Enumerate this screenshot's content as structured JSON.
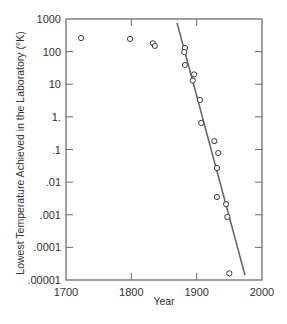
{
  "chart_data": {
    "type": "scatter",
    "title": "",
    "xlabel": "Year",
    "ylabel": "Lowest Temperature Achieved in the Laboratory (°K)",
    "xscale": "linear",
    "yscale": "log",
    "xlim": [
      1700,
      2000
    ],
    "ylim": [
      1e-05,
      1000
    ],
    "grid": false,
    "legend": null,
    "x_ticks": [
      {
        "value": 1700,
        "label": "1700"
      },
      {
        "value": 1800,
        "label": "1800"
      },
      {
        "value": 1900,
        "label": "1900"
      },
      {
        "value": 2000,
        "label": "2000"
      }
    ],
    "y_ticks": [
      {
        "value": 1000,
        "label": "1000"
      },
      {
        "value": 100,
        "label": "100"
      },
      {
        "value": 10,
        "label": "10"
      },
      {
        "value": 1,
        "label": "1."
      },
      {
        "value": 0.1,
        "label": ".1"
      },
      {
        "value": 0.01,
        "label": ".01"
      },
      {
        "value": 0.001,
        "label": ".001"
      },
      {
        "value": 0.0001,
        "label": ".0001"
      },
      {
        "value": 1e-05,
        "label": ".00001"
      }
    ],
    "series": [
      {
        "name": "Lowest temperature achieved",
        "type": "scatter",
        "marker": "open-circle",
        "points": [
          {
            "x": 1723,
            "y": 260
          },
          {
            "x": 1798,
            "y": 245
          },
          {
            "x": 1833,
            "y": 180
          },
          {
            "x": 1836,
            "y": 150
          },
          {
            "x": 1882,
            "y": 130
          },
          {
            "x": 1881,
            "y": 97
          },
          {
            "x": 1882,
            "y": 39
          },
          {
            "x": 1896,
            "y": 20
          },
          {
            "x": 1894,
            "y": 13
          },
          {
            "x": 1905,
            "y": 3.3
          },
          {
            "x": 1907,
            "y": 0.65
          },
          {
            "x": 1927,
            "y": 0.18
          },
          {
            "x": 1933,
            "y": 0.078
          },
          {
            "x": 1931,
            "y": 0.027
          },
          {
            "x": 1931,
            "y": 0.0035
          },
          {
            "x": 1945,
            "y": 0.0021
          },
          {
            "x": 1947,
            "y": 0.00085
          },
          {
            "x": 1950,
            "y": 1.6e-05
          }
        ]
      },
      {
        "name": "Trend line",
        "type": "line",
        "points": [
          {
            "x": 1870,
            "y": 750
          },
          {
            "x": 1974,
            "y": 1.4e-05
          }
        ]
      }
    ]
  },
  "colors": {
    "frame": "#6e6e6e",
    "line": "#6a6a6a",
    "marker_stroke": "#3a3a3a",
    "text": "#333333",
    "background": "#ffffff"
  }
}
